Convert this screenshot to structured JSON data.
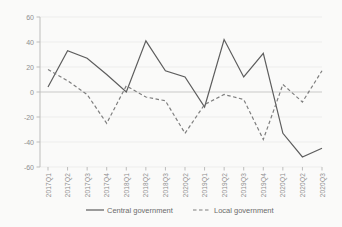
{
  "chart_data": {
    "type": "line",
    "title": "",
    "xlabel": "",
    "ylabel": "",
    "categories": [
      "2017Q1",
      "2017Q2",
      "2017Q3",
      "2017Q4",
      "2018Q1",
      "2018Q2",
      "2018Q3",
      "2020Q2",
      "2019Q1",
      "2019Q2",
      "2019Q3",
      "2019Q4",
      "2020Q1",
      "2020Q2",
      "2020Q3"
    ],
    "series": [
      {
        "name": "Central government",
        "style": "solid",
        "color": "#5d5d5d",
        "values": [
          4,
          33,
          27,
          14,
          0,
          41,
          17,
          12,
          -12,
          42,
          12,
          31,
          -33,
          -52,
          -45
        ]
      },
      {
        "name": "Local government",
        "style": "dashed",
        "color": "#7e7e7e",
        "values": [
          18,
          9,
          -2,
          -25,
          5,
          -4,
          -7,
          -33,
          -10,
          -2,
          -6,
          -38,
          6,
          -8,
          17
        ]
      }
    ],
    "ylim": [
      -60,
      60
    ],
    "y_ticks": [
      60,
      40,
      20,
      0,
      -20,
      -40,
      -60
    ],
    "grid": "faint horizontal lines at each 20 units, zero line emphasized",
    "legend_position": "bottom-center",
    "x_tick_label_rotation_deg": 90
  },
  "colors": {
    "background": "#fafaf9",
    "gridline": "#ededec",
    "zero_line": "#c9c9c8",
    "axis_spine": "#bdbdbc",
    "tick_mark": "#bdbdbc",
    "tick_text": "#8f8f8f",
    "legend_text": "#6b6b6b"
  }
}
